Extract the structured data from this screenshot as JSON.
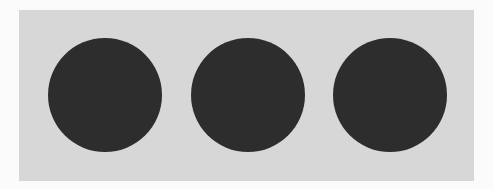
{
  "panel": {
    "background": "#d7d7d7"
  },
  "dots": {
    "count": 3,
    "color": "#2d2d2d",
    "items": [
      {
        "id": "dot-1",
        "left": 29,
        "top": 28
      },
      {
        "id": "dot-2",
        "left": 172,
        "top": 28
      },
      {
        "id": "dot-3",
        "left": 314,
        "top": 28
      }
    ]
  }
}
